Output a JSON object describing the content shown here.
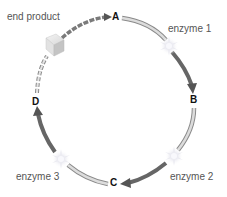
{
  "diagram": {
    "type": "metabolic-pathway-cycle",
    "nodes": [
      {
        "id": "A",
        "label": "A"
      },
      {
        "id": "B",
        "label": "B"
      },
      {
        "id": "C",
        "label": "C"
      },
      {
        "id": "D",
        "label": "D"
      }
    ],
    "enzymes": [
      {
        "label": "enzyme 1",
        "between": [
          "A",
          "B"
        ]
      },
      {
        "label": "enzyme 2",
        "between": [
          "B",
          "C"
        ]
      },
      {
        "label": "enzyme 3",
        "between": [
          "C",
          "D"
        ]
      }
    ],
    "end_product": {
      "label": "end product",
      "icon": "cube-icon"
    },
    "colors": {
      "arrow_dark": "#6b6b6b",
      "arrow_light": "#cfcfcf",
      "arrow_outline": "#8a8a8a",
      "label_text": "#555555",
      "node_text": "#111111"
    }
  }
}
